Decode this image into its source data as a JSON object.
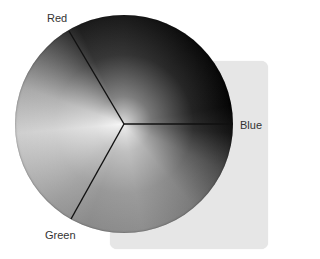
{
  "diagram": {
    "type": "color-wheel",
    "segments": [
      {
        "label": "Red"
      },
      {
        "label": "Blue"
      },
      {
        "label": "Green"
      }
    ],
    "colors": {
      "background": "#ffffff",
      "panel": "#e6e6e6",
      "divider": "#111111",
      "label_text": "#333333"
    }
  }
}
